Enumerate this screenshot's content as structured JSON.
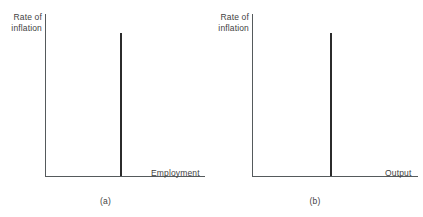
{
  "figure": {
    "background_color": "#ffffff",
    "axis_color": "#555a5c",
    "line_color": "#2b2b2b",
    "text_color": "#3f3f3f"
  },
  "panels": [
    {
      "id": "a",
      "caption": "(a)",
      "ylabel": "Rate of\ninflation",
      "xlabel": "Employment"
    },
    {
      "id": "b",
      "caption": "(b)",
      "ylabel": "Rate of\ninflation",
      "xlabel": "Output"
    }
  ],
  "chart_data": [
    {
      "type": "line",
      "title": "",
      "xlabel": "Employment",
      "ylabel": "Rate of inflation",
      "annotations": [
        "(a)"
      ],
      "grid": false,
      "legend": "none",
      "xlim": [
        0,
        1
      ],
      "ylim": [
        0,
        1
      ],
      "series": [
        {
          "name": "Long-run vertical Phillips curve",
          "x": [
            0.47,
            0.47
          ],
          "y": [
            0.0,
            0.89
          ]
        }
      ]
    },
    {
      "type": "line",
      "title": "",
      "xlabel": "Output",
      "ylabel": "Rate of inflation",
      "annotations": [
        "(b)"
      ],
      "grid": false,
      "legend": "none",
      "xlim": [
        0,
        1
      ],
      "ylim": [
        0,
        1
      ],
      "series": [
        {
          "name": "Long-run vertical aggregate supply",
          "x": [
            0.47,
            0.47
          ],
          "y": [
            0.0,
            0.89
          ]
        }
      ]
    }
  ]
}
